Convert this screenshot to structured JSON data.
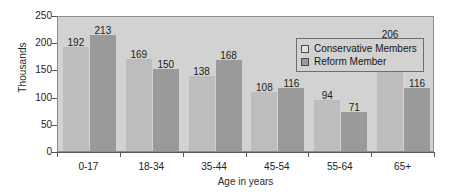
{
  "chart_data": {
    "type": "bar",
    "title": "",
    "xlabel": "Age in years",
    "ylabel": "Thousands",
    "categories": [
      "0-17",
      "18-34",
      "35-44",
      "45-54",
      "55-64",
      "65+"
    ],
    "series": [
      {
        "name": "Conservative Members",
        "color": "#bdbdbd",
        "values": [
          192,
          169,
          138,
          108,
          94,
          206
        ]
      },
      {
        "name": "Reform Member",
        "color": "#9a9a9a",
        "values": [
          213,
          150,
          168,
          116,
          71,
          116
        ]
      }
    ],
    "ylim": [
      0,
      250
    ],
    "yticks": [
      0,
      50,
      100,
      150,
      200,
      250
    ],
    "grid": false,
    "legend_position": "top-right",
    "data_labels": true,
    "plot_background": "#d2d2d2"
  },
  "legend": {
    "items": [
      {
        "label": "Conservative Members",
        "swatch": "light-gray-square-icon"
      },
      {
        "label": "Reform Member",
        "swatch": "dark-gray-square-icon"
      }
    ]
  },
  "axes": {
    "y_title": "Thousands",
    "x_title": "Age in years",
    "y_tick_labels": [
      "250",
      "200",
      "150",
      "100",
      "50",
      "0"
    ],
    "x_tick_labels": [
      "0-17",
      "18-34",
      "35-44",
      "45-54",
      "55-64",
      "65+"
    ]
  }
}
